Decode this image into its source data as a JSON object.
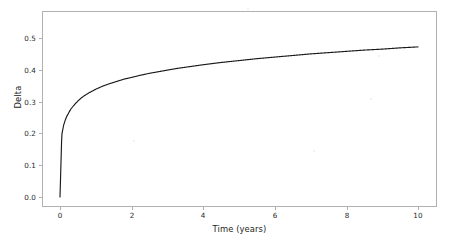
{
  "figure": {
    "background_color": "#ffffff",
    "frame_color": "#b0b0b0",
    "line_color": "#1a1a1a",
    "width": 456,
    "height": 242
  },
  "axes": {
    "x_title": "Time (years)",
    "y_title": "Delta",
    "x_ticks": [
      "0",
      "2",
      "4",
      "6",
      "8",
      "10"
    ],
    "y_ticks": [
      "0.0",
      "0.1",
      "0.2",
      "0.3",
      "0.4",
      "0.5"
    ]
  },
  "chart_data": {
    "type": "line",
    "title": "",
    "xlabel": "Time (years)",
    "ylabel": "Delta",
    "xlim": [
      -0.5,
      10.5
    ],
    "ylim": [
      -0.03,
      0.585
    ],
    "grid": false,
    "legend": null,
    "xticks": [
      0,
      2,
      4,
      6,
      8,
      10
    ],
    "yticks": [
      0.0,
      0.1,
      0.2,
      0.3,
      0.4,
      0.5
    ],
    "series": [
      {
        "name": "Delta",
        "color": "#1a1a1a",
        "linewidth": 1.15,
        "x": [
          0.0,
          0.05,
          0.1,
          0.15,
          0.2,
          0.3,
          0.4,
          0.5,
          0.6,
          0.7,
          0.8,
          0.9,
          1.0,
          1.2,
          1.4,
          1.6,
          1.8,
          2.0,
          2.25,
          2.5,
          2.75,
          3.0,
          3.25,
          3.5,
          3.75,
          4.0,
          4.5,
          5.0,
          5.5,
          6.0,
          6.5,
          7.0,
          7.5,
          8.0,
          8.5,
          9.0,
          9.5,
          10.0
        ],
        "y": [
          0.0,
          0.196,
          0.225,
          0.243,
          0.256,
          0.276,
          0.29,
          0.302,
          0.312,
          0.32,
          0.327,
          0.333,
          0.339,
          0.349,
          0.357,
          0.364,
          0.371,
          0.376,
          0.383,
          0.389,
          0.394,
          0.399,
          0.404,
          0.408,
          0.412,
          0.416,
          0.423,
          0.429,
          0.435,
          0.44,
          0.445,
          0.45,
          0.454,
          0.458,
          0.462,
          0.465,
          0.469,
          0.472
        ]
      }
    ]
  }
}
